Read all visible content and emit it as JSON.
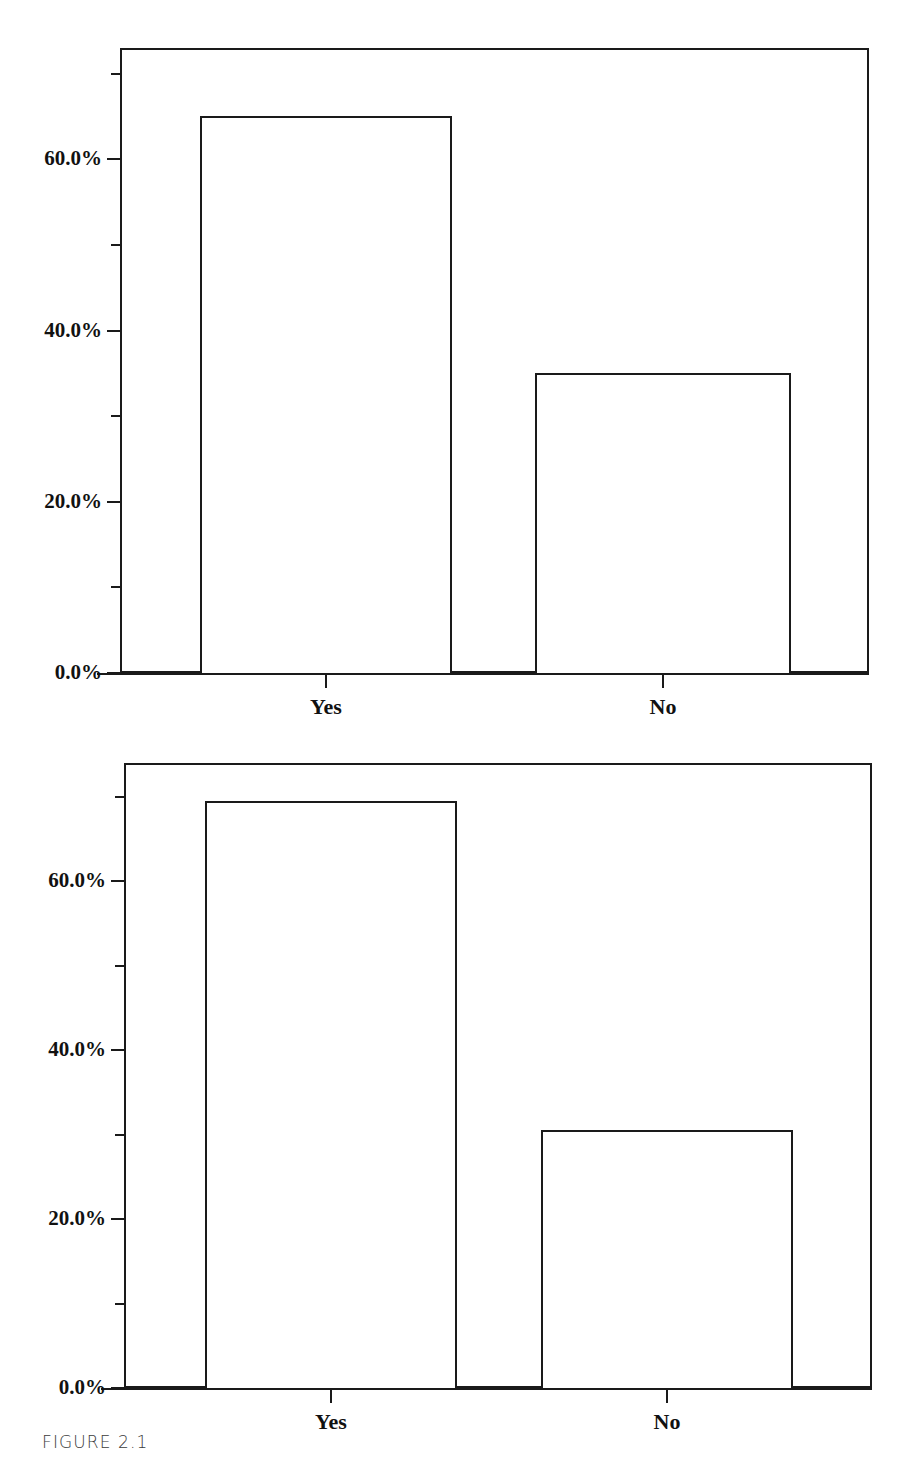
{
  "figure": {
    "caption": "FIGURE 2.1"
  },
  "charts": [
    {
      "id": "chart-top",
      "axis": {
        "y_major_labels": [
          "0.0%",
          "20.0%",
          "40.0%",
          "60.0%"
        ],
        "y_major_values": [
          0,
          20,
          40,
          60
        ],
        "y_minor_values": [
          10,
          30,
          50,
          70
        ],
        "x_labels": [
          "Yes",
          "No"
        ]
      }
    },
    {
      "id": "chart-bottom",
      "axis": {
        "y_major_labels": [
          "0.0%",
          "20.0%",
          "40.0%",
          "60.0%"
        ],
        "y_major_values": [
          0,
          20,
          40,
          60
        ],
        "y_minor_values": [
          10,
          30,
          50,
          70
        ],
        "x_labels": [
          "Yes",
          "No"
        ]
      }
    }
  ],
  "chart_data": [
    {
      "type": "bar",
      "id": "chart-top",
      "title": "",
      "subtitle": "",
      "xlabel": "",
      "ylabel": "",
      "categories": [
        "Yes",
        "No"
      ],
      "values": [
        65.0,
        35.0
      ],
      "value_labels": [
        "65.0%",
        "35.0%"
      ],
      "ylim": [
        0,
        73
      ],
      "ytick_values": [
        0,
        20,
        40,
        60
      ],
      "ytick_labels": [
        "0.0%",
        "20.0%",
        "40.0%",
        "60.0%"
      ],
      "yminor_tick_values": [
        10,
        30,
        50,
        70
      ],
      "grid": false,
      "legend": false,
      "legend_position": "none",
      "bar_fill": "#ffffff",
      "bar_edge": "#1a1a1a"
    },
    {
      "type": "bar",
      "id": "chart-bottom",
      "title": "",
      "subtitle": "",
      "xlabel": "",
      "ylabel": "",
      "categories": [
        "Yes",
        "No"
      ],
      "values": [
        69.5,
        30.5
      ],
      "value_labels": [
        "69.5%",
        "30.5%"
      ],
      "ylim": [
        0,
        74
      ],
      "ytick_values": [
        0,
        20,
        40,
        60
      ],
      "ytick_labels": [
        "0.0%",
        "20.0%",
        "40.0%",
        "60.0%"
      ],
      "yminor_tick_values": [
        10,
        30,
        50,
        70
      ],
      "grid": false,
      "legend": false,
      "legend_position": "none",
      "bar_fill": "#ffffff",
      "bar_edge": "#1a1a1a"
    }
  ],
  "colors": {
    "ink": "#1a1a1a",
    "paper": "#ffffff",
    "caption": "#3b3b3b"
  }
}
